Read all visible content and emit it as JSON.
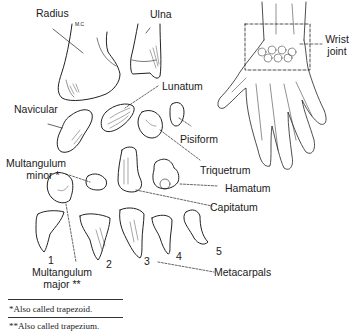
{
  "figure": {
    "labels": {
      "radius": "Radius",
      "ulna": "Ulna",
      "artist_initials": "M.C",
      "navicular": "Navicular",
      "lunatum": "Lunatum",
      "pisiform": "Pisiform",
      "triquetrum": "Triquetrum",
      "hamatum": "Hamatum",
      "capitatum": "Capitatum",
      "multangulum_minor_line1": "Multangulum",
      "multangulum_minor_line2": "minor *",
      "multangulum_major_line1": "Multangulum",
      "multangulum_major_line2": "major **",
      "metacarpals": "Metacarpals",
      "wrist_joint_line1": "Wrist",
      "wrist_joint_line2": "joint"
    },
    "metacarpal_numbers": [
      "1",
      "2",
      "3",
      "4",
      "5"
    ]
  },
  "footnotes": [
    "*Also called trapezoid.",
    "**Also called trapezium."
  ]
}
